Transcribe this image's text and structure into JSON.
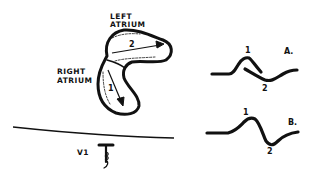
{
  "diagram": {
    "labels": {
      "left_atrium_line1": "LEFT",
      "left_atrium_line2": "ATRIUM",
      "right_atrium_line1": "RIGHT",
      "right_atrium_line2": "ATRIUM",
      "lead": "V1"
    },
    "vectors": {
      "right_atrial": "1",
      "left_atrial": "2"
    },
    "waveforms": [
      {
        "panel": "A.",
        "peak1": "1",
        "peak2": "2"
      },
      {
        "panel": "B.",
        "peak1": "1",
        "peak2": "2"
      }
    ],
    "colors": {
      "ink": "#111111",
      "background": "#ffffff"
    }
  }
}
